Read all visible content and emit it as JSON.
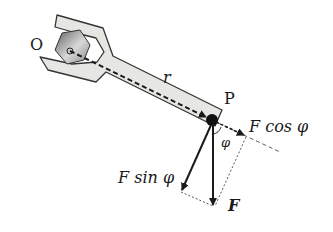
{
  "diagram": {
    "labels": {
      "origin": "O",
      "point": "P",
      "radius": "r",
      "angle": "φ",
      "force": "F",
      "parallel_component": "F cos φ",
      "perpendicular_component": "F sin φ"
    },
    "colors": {
      "wrench_fill": "#e6e6e2",
      "wrench_stroke": "#333333",
      "nut_dark": "#6e6e6e",
      "nut_light": "#e8e8e8",
      "arrow": "#1a1a1a"
    }
  }
}
